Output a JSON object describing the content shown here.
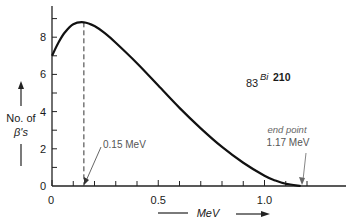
{
  "chart_data": {
    "type": "line",
    "title": "",
    "xlabel": "MeV",
    "ylabel": "No. of β's",
    "xlim": [
      0,
      1.38
    ],
    "ylim": [
      0,
      9.5
    ],
    "x_ticks": [
      0,
      0.1,
      0.2,
      0.3,
      0.4,
      0.5,
      0.6,
      0.7,
      0.8,
      0.9,
      1.0,
      1.1,
      1.2
    ],
    "x_tick_labels": [
      {
        "value": 0,
        "label": "0"
      },
      {
        "value": 0.5,
        "label": "0.5"
      },
      {
        "value": 1.0,
        "label": "1.0"
      }
    ],
    "y_ticks": [
      0,
      1,
      2,
      3,
      4,
      5,
      6,
      7,
      8,
      9
    ],
    "y_tick_labels": [
      {
        "value": 0,
        "label": "0"
      },
      {
        "value": 2,
        "label": "2"
      },
      {
        "value": 4,
        "label": "4"
      },
      {
        "value": 6,
        "label": "6"
      },
      {
        "value": 8,
        "label": "8"
      }
    ],
    "grid": false,
    "series": [
      {
        "name": "Bi-210 beta spectrum",
        "x": [
          0,
          0.03,
          0.06,
          0.1,
          0.15,
          0.2,
          0.25,
          0.3,
          0.4,
          0.5,
          0.6,
          0.7,
          0.8,
          0.9,
          1.0,
          1.05,
          1.1,
          1.17
        ],
        "y": [
          7.0,
          7.7,
          8.25,
          8.7,
          8.8,
          8.6,
          8.2,
          7.7,
          6.6,
          5.4,
          4.2,
          3.1,
          2.1,
          1.25,
          0.55,
          0.3,
          0.12,
          0.0
        ]
      }
    ],
    "annotations": {
      "isotope": {
        "mass_number_prefix": "83",
        "symbol": "Bi",
        "superscript": "210"
      },
      "peak": {
        "label": "0.15 MeV",
        "x": 0.15,
        "y_peak": 8.8
      },
      "endpoint": {
        "label_line1": "end point",
        "label_line2": "1.17 MeV",
        "x": 1.17
      }
    },
    "ylabel_lines": [
      "No. of",
      "β's"
    ]
  }
}
